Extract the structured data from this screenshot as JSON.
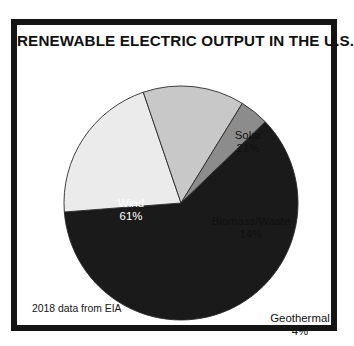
{
  "figure": {
    "title": "RENEWABLE ELECTRIC OUTPUT IN THE U.S.",
    "source_note": "2018 data from EIA",
    "frame_color": "#151515",
    "panel_color": "#ffffff"
  },
  "chart_data": {
    "type": "pie",
    "title": "RENEWABLE ELECTRIC OUTPUT IN THE U.S.",
    "subtitle": "",
    "xlabel": "",
    "ylabel": "",
    "categories": [
      "Wind",
      "Solar",
      "Biomass/Waste",
      "Geothermal"
    ],
    "values": [
      61,
      21,
      14,
      4
    ],
    "value_unit": "%",
    "labels": [
      "61%",
      "21%",
      "14%",
      "4%"
    ],
    "colors": [
      "#1a1a1a",
      "#ebebeb",
      "#c8c8c8",
      "#8c8c8c"
    ],
    "label_text_colors": [
      "#ffffff",
      "#101010",
      "#101010",
      "#101010"
    ],
    "start_angle_deg": -44,
    "direction": "clockwise",
    "legend": "none",
    "legend_position": "none",
    "grid": false,
    "annotations": [
      "2018 data from EIA"
    ],
    "slices": [
      {
        "name": "Wind",
        "value": 61,
        "label": "61%",
        "color": "#1a1a1a",
        "text_color": "#ffffff"
      },
      {
        "name": "Solar",
        "value": 21,
        "label": "21%",
        "color": "#ebebeb",
        "text_color": "#101010"
      },
      {
        "name": "Biomass/Waste",
        "value": 14,
        "label": "14%",
        "color": "#c8c8c8",
        "text_color": "#101010"
      },
      {
        "name": "Geothermal",
        "value": 4,
        "label": "4%",
        "color": "#8c8c8c",
        "text_color": "#101010"
      }
    ]
  }
}
